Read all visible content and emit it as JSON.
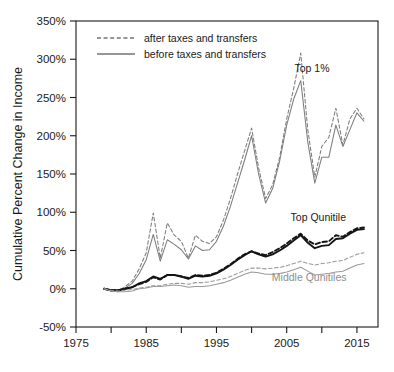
{
  "chart_data": {
    "type": "line",
    "title": "",
    "xlabel": "",
    "ylabel": "Cumulative Percent Change in Income",
    "xlim": [
      1975,
      2018
    ],
    "ylim": [
      -50,
      350
    ],
    "grid": false,
    "legend_position": "top-left",
    "y_ticks": [
      "-50%",
      "0%",
      "50%",
      "100%",
      "150%",
      "200%",
      "250%",
      "300%",
      "350%"
    ],
    "y_tick_values": [
      -50,
      0,
      50,
      100,
      150,
      200,
      250,
      300,
      350
    ],
    "x_ticks": [
      "1975",
      "1985",
      "1995",
      "2005",
      "2015"
    ],
    "x_tick_values": [
      1975,
      1985,
      1995,
      2005,
      2015
    ],
    "x_minor_tick_values": [
      1980,
      1990,
      2000,
      2010
    ],
    "legend": [
      {
        "label": "after taxes and transfers",
        "style": "dashed"
      },
      {
        "label": "before taxes and transfers",
        "style": "solid"
      }
    ],
    "annotations": [
      {
        "text": "Top 1%",
        "x": 2008.6,
        "y": 283,
        "color": "#1a1a1a"
      },
      {
        "text": "Top Qunitile",
        "x": 2009.5,
        "y": 88,
        "color": "#1a1a1a"
      },
      {
        "text": "Middle Qunitiles",
        "x": 2008.2,
        "y": 10,
        "color": "#8e8e8e"
      }
    ],
    "x": [
      1979,
      1980,
      1981,
      1982,
      1983,
      1984,
      1985,
      1986,
      1987,
      1988,
      1989,
      1990,
      1991,
      1992,
      1993,
      1994,
      1995,
      1996,
      1997,
      1998,
      1999,
      2000,
      2001,
      2002,
      2003,
      2004,
      2005,
      2006,
      2007,
      2008,
      2009,
      2010,
      2011,
      2012,
      2013,
      2014,
      2015,
      2016
    ],
    "series": [
      {
        "name": "Top 1% — before taxes and transfers",
        "group": "Top 1%",
        "style": "solid",
        "color": "#7d7d7d",
        "values": [
          0,
          -3,
          -4,
          1,
          7,
          20,
          38,
          71,
          36,
          64,
          58,
          51,
          39,
          56,
          50,
          51,
          62,
          82,
          108,
          138,
          168,
          200,
          150,
          112,
          131,
          167,
          214,
          248,
          272,
          192,
          138,
          172,
          172,
          214,
          186,
          208,
          230,
          219
        ]
      },
      {
        "name": "Top 1% — after taxes and transfers",
        "group": "Top 1%",
        "style": "dashed",
        "color": "#7d7d7d",
        "values": [
          0,
          -3,
          -3,
          3,
          10,
          26,
          47,
          99,
          40,
          86,
          70,
          62,
          40,
          70,
          62,
          59,
          68,
          90,
          118,
          150,
          180,
          210,
          158,
          118,
          136,
          172,
          222,
          262,
          308,
          208,
          146,
          186,
          198,
          236,
          188,
          222,
          236,
          222
        ]
      },
      {
        "name": "Top Quintile — before taxes and transfers",
        "group": "Top Qunitile",
        "style": "solid",
        "color": "#141414",
        "values": [
          0,
          -2,
          -2,
          0,
          2,
          7,
          10,
          16,
          13,
          18,
          18,
          16,
          13,
          17,
          16,
          17,
          20,
          25,
          31,
          38,
          44,
          49,
          45,
          42,
          45,
          50,
          56,
          63,
          70,
          60,
          53,
          56,
          57,
          65,
          66,
          72,
          77,
          78
        ]
      },
      {
        "name": "Top Quintile — after taxes and transfers",
        "group": "Top Qunitile",
        "style": "dashed",
        "color": "#141414",
        "values": [
          0,
          -2,
          -2,
          0,
          2,
          6,
          9,
          15,
          12,
          18,
          18,
          16,
          14,
          18,
          17,
          18,
          21,
          26,
          32,
          39,
          45,
          49,
          46,
          44,
          48,
          53,
          59,
          66,
          72,
          63,
          58,
          61,
          62,
          70,
          68,
          74,
          79,
          80
        ]
      },
      {
        "name": "Middle Quintiles — before taxes and transfers",
        "group": "Middle Qunitiles",
        "style": "solid",
        "color": "#9a9a9a",
        "values": [
          0,
          -3,
          -4,
          -4,
          -3,
          0,
          1,
          3,
          3,
          4,
          5,
          4,
          2,
          3,
          3,
          4,
          6,
          8,
          11,
          15,
          19,
          22,
          21,
          19,
          19,
          20,
          22,
          25,
          28,
          23,
          18,
          19,
          20,
          22,
          23,
          27,
          31,
          33
        ]
      },
      {
        "name": "Middle Quintiles — after taxes and transfers",
        "group": "Middle Qunitiles",
        "style": "dashed",
        "color": "#9a9a9a",
        "values": [
          0,
          -2,
          -3,
          -2,
          -1,
          1,
          2,
          4,
          4,
          6,
          7,
          7,
          6,
          8,
          8,
          9,
          11,
          13,
          16,
          20,
          24,
          27,
          27,
          26,
          27,
          28,
          30,
          33,
          36,
          33,
          31,
          33,
          34,
          36,
          37,
          41,
          45,
          47
        ]
      }
    ]
  }
}
